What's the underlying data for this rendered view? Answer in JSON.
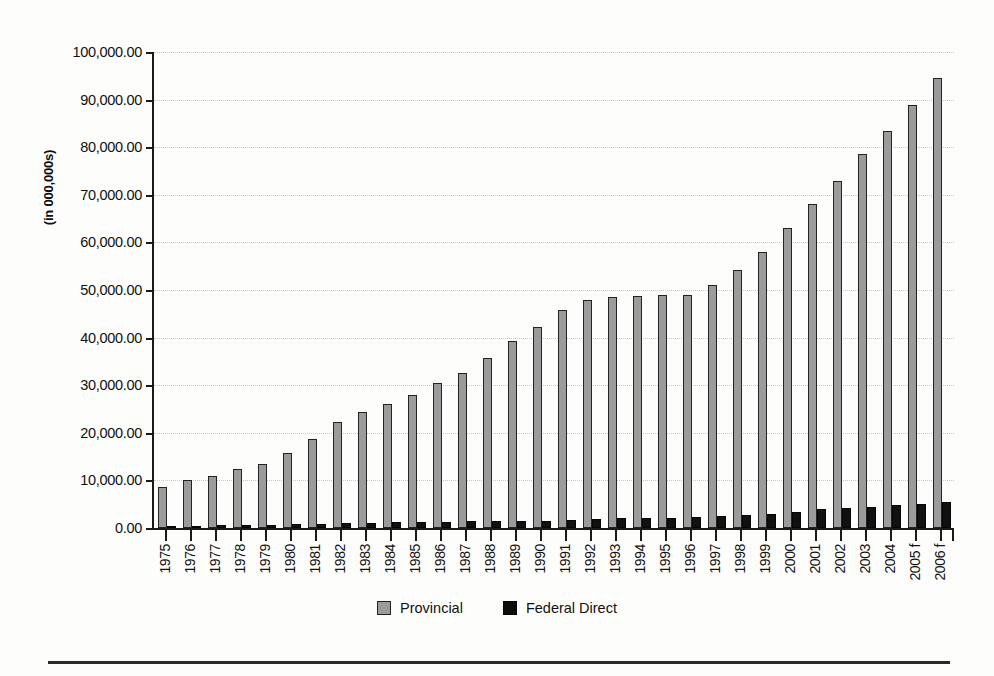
{
  "chart_data": {
    "type": "bar",
    "title": "",
    "subtitle": "",
    "xlabel": "",
    "ylabel": "(in 000,000s)",
    "ylim": [
      0,
      100000
    ],
    "ytick_values": [
      0,
      10000,
      20000,
      30000,
      40000,
      50000,
      60000,
      70000,
      80000,
      90000,
      100000
    ],
    "ytick_labels": [
      "0.00",
      "10,000.00",
      "20,000.00",
      "30,000.00",
      "40,000.00",
      "50,000.00",
      "60,000.00",
      "70,000.00",
      "80,000.00",
      "90,000.00",
      "100,000.00"
    ],
    "grid": true,
    "legend_position": "bottom-center",
    "categories": [
      "1975",
      "1976",
      "1977",
      "1978",
      "1979",
      "1980",
      "1981",
      "1982",
      "1983",
      "1984",
      "1985",
      "1986",
      "1987",
      "1988",
      "1989",
      "1990",
      "1991",
      "1992",
      "1993",
      "1994",
      "1995",
      "1996",
      "1997",
      "1998",
      "1999",
      "2000",
      "2001",
      "2002",
      "2003",
      "2004",
      "2005 f",
      "2006 f"
    ],
    "series": [
      {
        "name": "Provincial",
        "color": "#9b9b9b",
        "values": [
          8600,
          10000,
          10900,
          12300,
          13500,
          15700,
          18800,
          22300,
          24300,
          26100,
          28000,
          30400,
          32600,
          35700,
          39200,
          42300,
          45900,
          48000,
          48500,
          48800,
          49000,
          48900,
          51000,
          54300,
          58000,
          63000,
          68000,
          72800,
          78500,
          83500,
          88900,
          94500
        ]
      },
      {
        "name": "Federal Direct",
        "color": "#111111",
        "values": [
          450,
          500,
          550,
          650,
          700,
          800,
          850,
          1000,
          1150,
          1250,
          1300,
          1350,
          1400,
          1400,
          1400,
          1450,
          1700,
          1900,
          2000,
          2100,
          2200,
          2300,
          2600,
          2750,
          3000,
          3400,
          3900,
          4100,
          4500,
          4800,
          5100,
          5500
        ]
      }
    ]
  },
  "legend": {
    "items": [
      {
        "label": "Provincial",
        "color": "#9b9b9b"
      },
      {
        "label": "Federal Direct",
        "color": "#111111"
      }
    ]
  }
}
